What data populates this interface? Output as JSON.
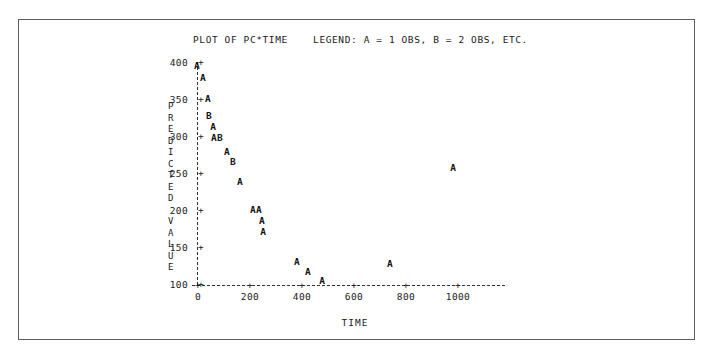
{
  "chart_data": {
    "type": "scatter",
    "title": "PLOT OF PC*TIME    LEGEND: A = 1 OBS, B = 2 OBS, ETC.",
    "xlabel": "TIME",
    "ylabel": "PREDICTED VALUE",
    "ylabel_chars": [
      "P",
      "R",
      "E",
      "D",
      "I",
      "C",
      "T",
      "E",
      "D",
      "",
      "V",
      "A",
      "L",
      "U",
      "E"
    ],
    "xlim": [
      -40,
      1160
    ],
    "ylim": [
      100,
      400
    ],
    "xticks": [
      0,
      200,
      400,
      600,
      800,
      1000
    ],
    "xtick_labels": [
      "0",
      "200",
      "400",
      "600",
      "800",
      "1000"
    ],
    "yticks": [
      400,
      350,
      300,
      250,
      200,
      150,
      100
    ],
    "ytick_labels": [
      "400",
      "350",
      "300",
      "250",
      "200",
      "150",
      "100"
    ],
    "tick_mark": "+",
    "grid": false,
    "legend": "A = 1 OBS, B = 2 OBS, ETC.",
    "axis_color": "#333333",
    "text_color": "#1a1a1a",
    "points": [
      {
        "label": "A",
        "x": -4,
        "y": 394,
        "count": 1
      },
      {
        "label": "A",
        "x": 19,
        "y": 379,
        "count": 1
      },
      {
        "label": "A",
        "x": 38,
        "y": 350,
        "count": 1
      },
      {
        "label": "B",
        "x": 42,
        "y": 327,
        "count": 2
      },
      {
        "label": "A",
        "x": 58,
        "y": 312,
        "count": 1
      },
      {
        "label": "A",
        "x": 61,
        "y": 297,
        "count": 1
      },
      {
        "label": "B",
        "x": 84,
        "y": 297,
        "count": 2
      },
      {
        "label": "A",
        "x": 111,
        "y": 279,
        "count": 1
      },
      {
        "label": "B",
        "x": 134,
        "y": 265,
        "count": 2
      },
      {
        "label": "A",
        "x": 161,
        "y": 238,
        "count": 1
      },
      {
        "label": "A",
        "x": 211,
        "y": 200,
        "count": 1
      },
      {
        "label": "A",
        "x": 234,
        "y": 200,
        "count": 1
      },
      {
        "label": "A",
        "x": 246,
        "y": 185,
        "count": 1
      },
      {
        "label": "A",
        "x": 250,
        "y": 170,
        "count": 1
      },
      {
        "label": "A",
        "x": 380,
        "y": 130,
        "count": 1
      },
      {
        "label": "A",
        "x": 423,
        "y": 116,
        "count": 1
      },
      {
        "label": "A",
        "x": 477,
        "y": 104,
        "count": 1
      },
      {
        "label": "A",
        "x": 738,
        "y": 127,
        "count": 1
      },
      {
        "label": "A",
        "x": 981,
        "y": 257,
        "count": 1
      }
    ]
  }
}
